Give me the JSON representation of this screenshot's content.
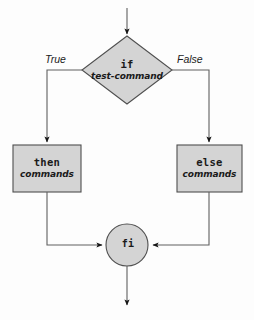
{
  "diagram": {
    "type": "flowchart",
    "colors": {
      "node_fill": "#d4d4d4",
      "node_stroke": "#555555",
      "line": "#555555",
      "arrow": "#1a1a1a",
      "text": "#1a1a1a",
      "background": "#fdfdfd"
    },
    "nodes": {
      "decision": {
        "shape": "diamond",
        "keyword": "if",
        "subtitle": "test-command"
      },
      "then_branch": {
        "shape": "rectangle",
        "keyword": "then",
        "subtitle": "commands"
      },
      "else_branch": {
        "shape": "rectangle",
        "keyword": "else",
        "subtitle": "commands"
      },
      "terminator": {
        "shape": "circle",
        "keyword": "fi"
      }
    },
    "edge_labels": {
      "true_branch": "True",
      "false_branch": "False"
    }
  }
}
